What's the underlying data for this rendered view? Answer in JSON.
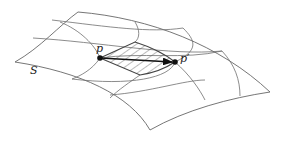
{
  "diagram": {
    "type": "surface-grid-with-hatched-region",
    "labels": {
      "surface": "S",
      "point_start": "p",
      "point_end": "p′"
    },
    "colors": {
      "line": "#6f6f6f",
      "arrow": "#111111",
      "background": "#ffffff"
    }
  }
}
